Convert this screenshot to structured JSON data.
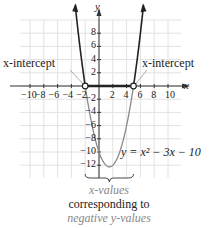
{
  "chart_data": {
    "type": "line",
    "title": "",
    "equation": "y = x^2 - 3x - 10",
    "equation_label": "y = x² − 3x − 10",
    "xlabel": "x",
    "ylabel": "y",
    "xlim": [
      -11,
      12
    ],
    "ylim": [
      -13,
      11
    ],
    "grid": true,
    "grid_step": 2,
    "x_ticks": [
      -10,
      -8,
      -6,
      -4,
      -2,
      2,
      4,
      6,
      8,
      10
    ],
    "x_tick_labels": [
      "−10",
      "−8",
      "−6",
      "−4",
      "−2",
      "2",
      "4",
      "6",
      "8",
      "10"
    ],
    "y_ticks": [
      -12,
      -10,
      -8,
      -6,
      -4,
      -2,
      2,
      4,
      6,
      8
    ],
    "y_tick_labels": [
      "−12",
      "−10",
      "−8",
      "−6",
      "−4",
      "−2",
      "2",
      "4",
      "6",
      "8"
    ],
    "x_intercepts": [
      -2,
      5
    ],
    "vertex": [
      1.5,
      -12.25
    ],
    "highlighted_interval": [
      -2,
      5
    ],
    "annotations": [
      {
        "text": "x-intercept",
        "points_to": [
          -2,
          0
        ]
      },
      {
        "text": "x-intercept",
        "points_to": [
          5,
          0
        ]
      }
    ],
    "series": [
      {
        "name": "y = x^2 - 3x - 10",
        "x": [
          -4,
          -3,
          -2,
          -1,
          0,
          1,
          1.5,
          2,
          3,
          4,
          5,
          6,
          7
        ],
        "values": [
          18,
          8,
          0,
          -6,
          -10,
          -12,
          -12.25,
          -12,
          -10,
          -6,
          0,
          8,
          18
        ]
      }
    ]
  },
  "labels": {
    "y_axis": "y",
    "x_axis": "x",
    "left_intercept": "x-intercept",
    "right_intercept": "x-intercept",
    "equation": "y = x² − 3x − 10"
  },
  "caption": {
    "line1": "x-values",
    "line2": "corresponding to",
    "line3": "negative y-values"
  },
  "colors": {
    "curve_positive": "#222222",
    "curve_negative": "#8a8a8a",
    "grid": "#e2e2e2",
    "caption_gray": "#888888"
  }
}
